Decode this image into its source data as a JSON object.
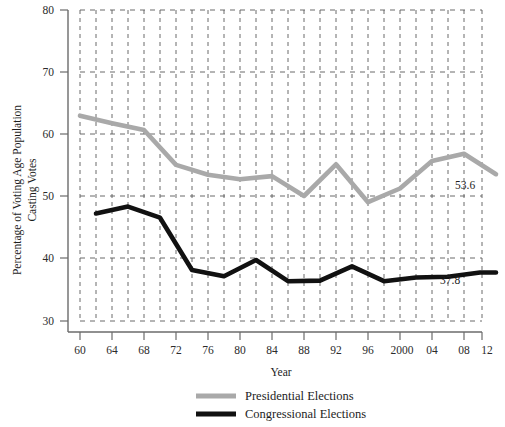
{
  "chart_data": {
    "type": "line",
    "title": "",
    "xlabel": "Year",
    "ylabel": "Percentage of Voting Age Population Casting Votes",
    "ylabel_line1": "Percentage of Voting Age Population",
    "ylabel_line2": "Casting Votes",
    "xlim": [
      1959,
      2013
    ],
    "ylim": [
      28,
      80
    ],
    "yticks": [
      30,
      40,
      50,
      60,
      70,
      80
    ],
    "ytick_labels": [
      "30",
      "40",
      "50",
      "60",
      "70",
      "80"
    ],
    "xticks": [
      1960,
      1964,
      1968,
      1972,
      1976,
      1980,
      1984,
      1988,
      1992,
      1996,
      2000,
      2004,
      2008,
      2012
    ],
    "xtick_labels": [
      "60",
      "64",
      "68",
      "72",
      "76",
      "80",
      "84",
      "88",
      "92",
      "96",
      "2000",
      "04",
      "08",
      "12"
    ],
    "xminor_ticks": [
      1962,
      1966,
      1970,
      1974,
      1978,
      1982,
      1986,
      1990,
      1994,
      1998,
      2002,
      2006,
      2010
    ],
    "grid": "dashed",
    "grid_color": "#555555",
    "legend_position": "bottom-center",
    "series": [
      {
        "name": "Presidential Elections",
        "color": "#a9a9a9",
        "x": [
          1960,
          1964,
          1968,
          1972,
          1976,
          1980,
          1984,
          1988,
          1992,
          1996,
          2000,
          2004,
          2008,
          2012
        ],
        "values": [
          63.0,
          61.8,
          60.7,
          55.1,
          53.5,
          52.8,
          53.3,
          50.1,
          55.2,
          49.1,
          51.3,
          55.7,
          56.9,
          53.6
        ]
      },
      {
        "name": "Congressional Elections",
        "color": "#111111",
        "x": [
          1962,
          1966,
          1970,
          1974,
          1978,
          1982,
          1986,
          1990,
          1994,
          1998,
          2002,
          2006,
          2010,
          2012
        ],
        "values": [
          47.3,
          48.4,
          46.6,
          38.2,
          37.2,
          39.8,
          36.4,
          36.5,
          38.8,
          36.4,
          37.0,
          37.1,
          37.8,
          37.8
        ]
      }
    ],
    "annotations": [
      {
        "text": "53.6",
        "series": "Presidential Elections",
        "x": 2012,
        "y": 53.6
      },
      {
        "text": "37.8",
        "series": "Congressional Elections",
        "x": 2012,
        "y": 37.8
      }
    ]
  },
  "legend": {
    "items": [
      {
        "label": "Presidential Elections",
        "color": "#a9a9a9"
      },
      {
        "label": "Congressional Elections",
        "color": "#111111"
      }
    ]
  },
  "axes": {
    "x_title": "Year",
    "y_title_line1": "Percentage of Voting Age Population",
    "y_title_line2": "Casting Votes",
    "y_tick_80": "80",
    "y_tick_70": "70",
    "y_tick_60": "60",
    "y_tick_50": "50",
    "y_tick_40": "40",
    "y_tick_30": "30",
    "x_tick_0": "60",
    "x_tick_1": "64",
    "x_tick_2": "68",
    "x_tick_3": "72",
    "x_tick_4": "76",
    "x_tick_5": "80",
    "x_tick_6": "84",
    "x_tick_7": "88",
    "x_tick_8": "92",
    "x_tick_9": "96",
    "x_tick_10": "2000",
    "x_tick_11": "04",
    "x_tick_12": "08",
    "x_tick_13": "12"
  },
  "labels": {
    "presidential_end": "53.6",
    "congressional_end": "37.8"
  }
}
